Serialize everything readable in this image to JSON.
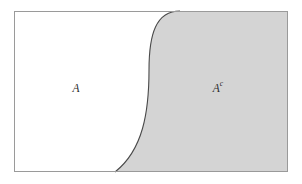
{
  "figure": {
    "name": "set-complement-diagram",
    "canvas": {
      "width": 302,
      "height": 184
    },
    "background_color": "#ffffff"
  },
  "universe_rect": {
    "label": "universe-rectangle",
    "x": 14,
    "y": 11,
    "width": 274,
    "height": 161,
    "fill": "#ffffff",
    "border_color": "#9a9a9a",
    "border_width": 1
  },
  "regions": [
    {
      "id": "region-a",
      "label": "A",
      "superscript": "",
      "fill": "#ffffff",
      "label_x": 76,
      "label_y": 89
    },
    {
      "id": "region-a-complement",
      "label": "A",
      "superscript": "c",
      "fill": "#d4d4d4",
      "label_x": 218,
      "label_y": 89
    }
  ],
  "divider_curve": {
    "name": "set-boundary-curve",
    "stroke": "#4a4a4a",
    "stroke_width": 1.1,
    "top_intersection_x": 180,
    "bottom_intersection_x": 115,
    "midpoint_x": 149,
    "path": "M 180 11 C 156 11 149 34 149 70 C 149 112 143 150 115 172"
  }
}
